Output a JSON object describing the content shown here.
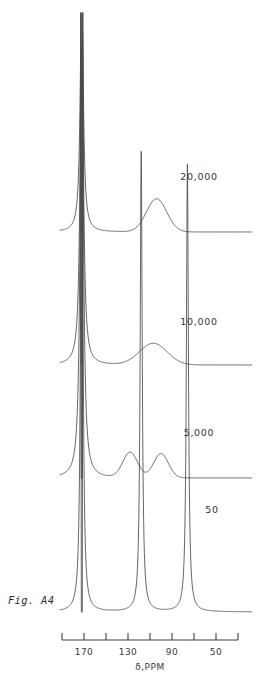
{
  "figure": {
    "caption": "Fig. A4",
    "axis_title": "δ,PPM",
    "axis": {
      "tick_values": [
        190,
        180,
        170,
        160,
        150,
        140,
        130,
        120,
        110,
        100,
        90,
        80,
        70,
        60,
        50
      ],
      "labeled_ticks": [
        "170",
        "130",
        "90",
        "50"
      ],
      "range_ppm": [
        195,
        40
      ],
      "n_ticks": 9,
      "tick_step_ppm": 20,
      "first_tick_ppm": 190,
      "last_tick_ppm": 30
    },
    "trace_labels": [
      "20,000",
      "10,000",
      "5,000",
      "50"
    ],
    "colors": {
      "trace": "#4a4a4a",
      "axis": "#3d3d3d",
      "text": "#333333",
      "background": "#ffffff"
    }
  },
  "chart_data": {
    "type": "line",
    "title": "Fig. A4",
    "xlabel": "δ,PPM",
    "ylabel": "",
    "xlim": [
      195,
      40
    ],
    "grid": false,
    "legend": "inline-right-labels",
    "series": [
      {
        "name": "20,000",
        "label": "20,000",
        "baseline_y_px": 232,
        "label_x_px": 199,
        "label_y_px": 180,
        "peaks": [
          {
            "shift_ppm": 172,
            "height": 1.0,
            "width_ppm": 1.6,
            "type": "sharp",
            "clipped": true
          },
          {
            "shift_ppm": 104,
            "height": 0.128,
            "width_ppm": 11.0,
            "type": "broad"
          }
        ]
      },
      {
        "name": "10,000",
        "label": "10,000",
        "baseline_y_px": 365,
        "label_x_px": 199,
        "label_y_px": 325,
        "peaks": [
          {
            "shift_ppm": 172,
            "height": 1.0,
            "width_ppm": 1.6,
            "type": "sharp",
            "clipped": true
          },
          {
            "shift_ppm": 107,
            "height": 0.055,
            "width_ppm": 15.0,
            "type": "broad"
          }
        ]
      },
      {
        "name": "5,000",
        "label": "5,000",
        "baseline_y_px": 478,
        "label_x_px": 199,
        "label_y_px": 436,
        "peaks": [
          {
            "shift_ppm": 172,
            "height": 1.0,
            "width_ppm": 1.6,
            "type": "sharp",
            "clipped": true
          },
          {
            "shift_ppm": 128,
            "height": 0.05,
            "width_ppm": 8.0,
            "type": "broad"
          },
          {
            "shift_ppm": 100,
            "height": 0.048,
            "width_ppm": 8.0,
            "type": "broad"
          }
        ]
      },
      {
        "name": "50",
        "label": "50",
        "baseline_y_px": 612,
        "label_x_px": 212,
        "label_y_px": 513,
        "peaks": [
          {
            "shift_ppm": 172,
            "height": 1.0,
            "width_ppm": 1.1,
            "type": "sharp",
            "clipped": true
          },
          {
            "shift_ppm": 118,
            "height": 0.72,
            "width_ppm": 1.1,
            "type": "sharp"
          },
          {
            "shift_ppm": 76,
            "height": 0.7,
            "width_ppm": 1.1,
            "type": "sharp"
          }
        ]
      }
    ]
  }
}
